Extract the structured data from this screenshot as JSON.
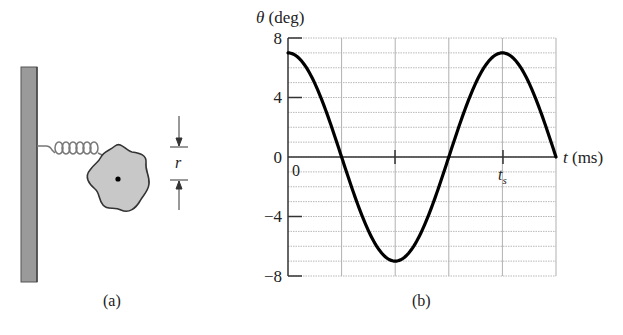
{
  "figure_a": {
    "caption": "(a)",
    "dimension_label": "r",
    "parts": [
      "wall",
      "spring",
      "rigid-body",
      "pivot"
    ]
  },
  "figure_b": {
    "caption": "(b)",
    "y_axis_symbol": "θ",
    "y_axis_unit": "(deg)",
    "x_axis_symbol": "t",
    "x_axis_unit": "(ms)",
    "origin_label": "0",
    "ts_label": "t",
    "ts_subscript": "s",
    "y_ticks": [
      "8",
      "4",
      "0",
      "−4",
      "−8"
    ]
  },
  "chart_data": {
    "type": "line",
    "title": "",
    "xlabel": "t (ms)",
    "ylabel": "θ (deg)",
    "ylim": [
      -8,
      8
    ],
    "y_ticks": [
      8,
      4,
      0,
      -4,
      -8
    ],
    "x_ticks_labeled": [
      {
        "pos": 0,
        "label": "0"
      },
      {
        "pos": 4,
        "label": "t_s"
      }
    ],
    "x_range_divisions": [
      0,
      5
    ],
    "grid": true,
    "grid_vertical_divisions": 5,
    "grid_horizontal_step": 1,
    "series": [
      {
        "name": "θ(t)",
        "formula": "7·cos(2π·x/4), x in grid divisions",
        "x": [
          0,
          0.5,
          1,
          1.5,
          2,
          2.5,
          3,
          3.5,
          4,
          4.5,
          5
        ],
        "values": [
          7,
          4.95,
          0,
          -4.95,
          -7,
          -4.95,
          0,
          4.95,
          7,
          4.95,
          0
        ]
      }
    ],
    "annotations": [
      "t_s marks the maximum at division 4 (one period)"
    ]
  }
}
